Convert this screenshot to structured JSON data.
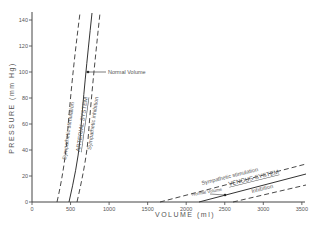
{
  "chart_data": {
    "type": "line",
    "title": "",
    "xlabel": "VOLUME (ml)",
    "ylabel": "PRESSURE (mm Hg)",
    "xlim": [
      0,
      3500
    ],
    "ylim": [
      0,
      145
    ],
    "x_ticks": [
      "0",
      "500",
      "1000",
      "1500",
      "2000",
      "2500",
      "3000",
      "3500"
    ],
    "y_ticks": [
      "0",
      "20",
      "40",
      "60",
      "80",
      "100",
      "120",
      "140"
    ],
    "grid": false,
    "series": [
      {
        "name": "Sympathetic stimulation (arterial)",
        "style": "dashed",
        "points": [
          [
            330,
            0
          ],
          [
            400,
            20
          ],
          [
            450,
            40
          ],
          [
            490,
            60
          ],
          [
            530,
            80
          ],
          [
            560,
            100
          ],
          [
            590,
            120
          ],
          [
            620,
            145
          ]
        ]
      },
      {
        "name": "ARTERIAL SYSTEM",
        "style": "solid",
        "points": [
          [
            500,
            0
          ],
          [
            560,
            20
          ],
          [
            600,
            40
          ],
          [
            640,
            60
          ],
          [
            680,
            80
          ],
          [
            710,
            100
          ],
          [
            740,
            120
          ],
          [
            780,
            145
          ]
        ]
      },
      {
        "name": "Sympathetic inhibition (arterial)",
        "style": "dashed",
        "points": [
          [
            590,
            0
          ],
          [
            660,
            20
          ],
          [
            700,
            40
          ],
          [
            740,
            60
          ],
          [
            780,
            80
          ],
          [
            810,
            100
          ],
          [
            840,
            120
          ],
          [
            880,
            145
          ]
        ]
      },
      {
        "name": "Sympathetic stimulation (venous)",
        "style": "dashed",
        "points": [
          [
            1660,
            0
          ],
          [
            3550,
            28
          ]
        ]
      },
      {
        "name": "VENOUS SYSTEM",
        "style": "solid",
        "points": [
          [
            2170,
            0
          ],
          [
            3550,
            21
          ]
        ]
      },
      {
        "name": "Inhibition (venous)",
        "style": "dashed",
        "points": [
          [
            2600,
            0
          ],
          [
            3550,
            12
          ]
        ]
      }
    ],
    "annotations": [
      {
        "text": "Normal Volume",
        "x": 720,
        "y": 100
      },
      {
        "text": "Normal Volume",
        "x": 2500,
        "y": 7
      }
    ]
  },
  "labels": {
    "x_axis": "VOLUME  (ml)",
    "y_axis": "PRESSURE  (mm Hg)",
    "art_stim": "Sympathetic stimulation",
    "art_sys": "ARTERIAL SYSTEM",
    "art_inh": "Sympathetic inhibition",
    "normal_art": "Normal Volume",
    "ven_stim": "Sympathetic stimulation",
    "ven_sys": "VENOUS SYSTEM",
    "ven_inh": "Inhibition",
    "normal_ven": "Normal Volume"
  }
}
